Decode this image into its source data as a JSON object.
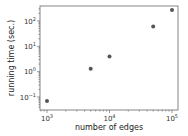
{
  "chart_data": {
    "type": "scatter",
    "title": "",
    "xlabel": "number of edges",
    "ylabel": "running time (sec.)",
    "xscale": "log",
    "yscale": "log",
    "xlim": [
      800,
      120000
    ],
    "ylim": [
      0.05,
      500
    ],
    "grid": false,
    "legend": null,
    "x_ticks": [
      {
        "value": 1000,
        "base": "10",
        "exp": "3"
      },
      {
        "value": 10000,
        "base": "10",
        "exp": "4"
      },
      {
        "value": 100000,
        "base": "10",
        "exp": "5"
      }
    ],
    "y_ticks": [
      {
        "value": 0.1,
        "base": "10",
        "exp": "−1"
      },
      {
        "value": 1,
        "base": "10",
        "exp": "0"
      },
      {
        "value": 10,
        "base": "10",
        "exp": "1"
      },
      {
        "value": 100,
        "base": "10",
        "exp": "2"
      }
    ],
    "series": [
      {
        "name": "running time",
        "color": "#555555",
        "points": [
          {
            "x": 1000,
            "y": 0.07
          },
          {
            "x": 5000,
            "y": 1.3
          },
          {
            "x": 10000,
            "y": 4
          },
          {
            "x": 50000,
            "y": 60
          },
          {
            "x": 100000,
            "y": 270
          }
        ]
      }
    ]
  }
}
